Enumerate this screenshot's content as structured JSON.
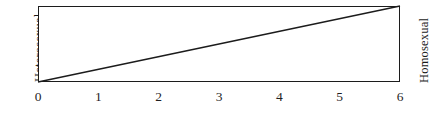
{
  "figure": {
    "left_axis_label": "Heterosexual",
    "right_axis_label": "Homosexual",
    "line_color": "#1c1c1c",
    "frame_color": "#1c1c1c",
    "background_color": "#ffffff"
  },
  "chart_data": {
    "type": "line",
    "title": "",
    "subtitle": "",
    "xlabel": "",
    "ylabel": "",
    "x": [
      0,
      1,
      2,
      3,
      4,
      5,
      6
    ],
    "values": [
      0,
      1,
      2,
      3,
      4,
      5,
      6
    ],
    "series": [
      {
        "name": "Kinsey continuum",
        "values": [
          0,
          1,
          2,
          3,
          4,
          5,
          6
        ]
      }
    ],
    "tick_labels": [
      "0",
      "1",
      "2",
      "3",
      "4",
      "5",
      "6"
    ],
    "xlim": [
      0,
      6
    ],
    "ylim": [
      0,
      6
    ],
    "grid": false,
    "legend": false,
    "annotations": [
      {
        "text": "Heterosexual",
        "position": "left",
        "rotation": -90
      },
      {
        "text": "Homosexual",
        "position": "right",
        "rotation": -90
      }
    ]
  }
}
